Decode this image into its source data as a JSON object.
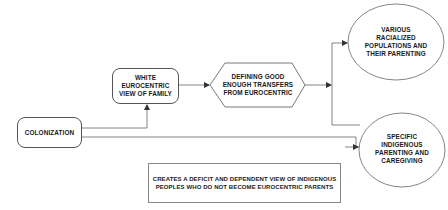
{
  "diagram": {
    "nodes": {
      "colonization": {
        "label": "COLONIZATION",
        "shape": "rounded-rect"
      },
      "white_view": {
        "label": "WHITE\nEUROCENTRIC\nVIEW OF FAMILY",
        "shape": "rounded-rect"
      },
      "defining": {
        "label": "DEFINING GOOD\nENOUGH TRANSFERS\nFROM EUROCENTRIC",
        "shape": "hexagon"
      },
      "various": {
        "label": "VARIOUS\nRACIALIZED\nPOPULATIONS AND\nTHEIR PARENTING",
        "shape": "ellipse"
      },
      "specific": {
        "label": "SPECIFIC\nINDIGENOUS\nPARENTING AND\nCAREGIVING",
        "shape": "ellipse"
      },
      "deficit": {
        "label": "CREATES A DEFICIT AND DEPENDENT VIEW OF INDIGENOUS\nPEOPLES WHO DO NOT BECOME EUROCENTRIC PARENTS",
        "shape": "rect"
      }
    },
    "edges": [
      {
        "from": "colonization",
        "to": "white_view"
      },
      {
        "from": "colonization",
        "to": "specific"
      },
      {
        "from": "white_view",
        "to": "defining"
      },
      {
        "from": "defining",
        "to": "various"
      },
      {
        "from": "defining",
        "to": "specific"
      }
    ],
    "colors": {
      "stroke": "#555555",
      "text": "#1a1a1a",
      "background": "#ffffff"
    }
  }
}
